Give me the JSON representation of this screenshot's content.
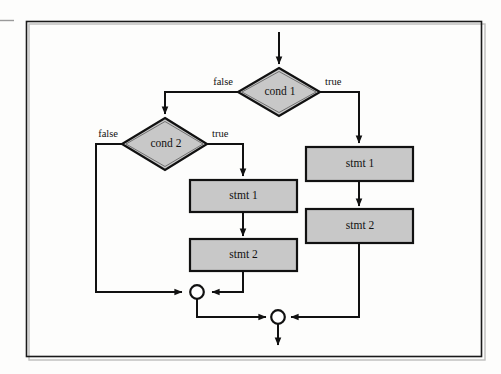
{
  "figure": {
    "kind": "flowchart",
    "title_visible": false,
    "background_color": "#fdfdfc",
    "frame_color": "#1a1a1a",
    "node_fill_color": "#c8c8c8",
    "node_stroke_color": "#111111",
    "edge_color": "#111111"
  },
  "nodes": {
    "cond1": {
      "label": "cond 1",
      "shape": "diamond"
    },
    "cond2": {
      "label": "cond 2",
      "shape": "diamond"
    },
    "left_stmt1": {
      "label": "stmt 1",
      "shape": "rectangle"
    },
    "left_stmt2": {
      "label": "stmt 2",
      "shape": "rectangle"
    },
    "right_stmt1": {
      "label": "stmt 1",
      "shape": "rectangle"
    },
    "right_stmt2": {
      "label": "stmt 2",
      "shape": "rectangle"
    },
    "merge_inner": {
      "label": "",
      "shape": "circle"
    },
    "merge_outer": {
      "label": "",
      "shape": "circle"
    }
  },
  "edge_labels": {
    "cond1_false": "false",
    "cond1_true": "true",
    "cond2_false": "false",
    "cond2_true": "true"
  },
  "graph": {
    "entry": "cond1",
    "edges": [
      {
        "from": "entry-arrow",
        "to": "cond1",
        "label": ""
      },
      {
        "from": "cond1",
        "to": "cond2",
        "label": "false"
      },
      {
        "from": "cond1",
        "to": "right_stmt1",
        "label": "true"
      },
      {
        "from": "cond2",
        "to": "merge_inner",
        "label": "false"
      },
      {
        "from": "cond2",
        "to": "left_stmt1",
        "label": "true"
      },
      {
        "from": "left_stmt1",
        "to": "left_stmt2",
        "label": ""
      },
      {
        "from": "left_stmt2",
        "to": "merge_inner",
        "label": ""
      },
      {
        "from": "right_stmt1",
        "to": "right_stmt2",
        "label": ""
      },
      {
        "from": "right_stmt2",
        "to": "merge_outer",
        "label": ""
      },
      {
        "from": "merge_inner",
        "to": "merge_outer",
        "label": ""
      },
      {
        "from": "merge_outer",
        "to": "exit-arrow",
        "label": ""
      }
    ]
  }
}
